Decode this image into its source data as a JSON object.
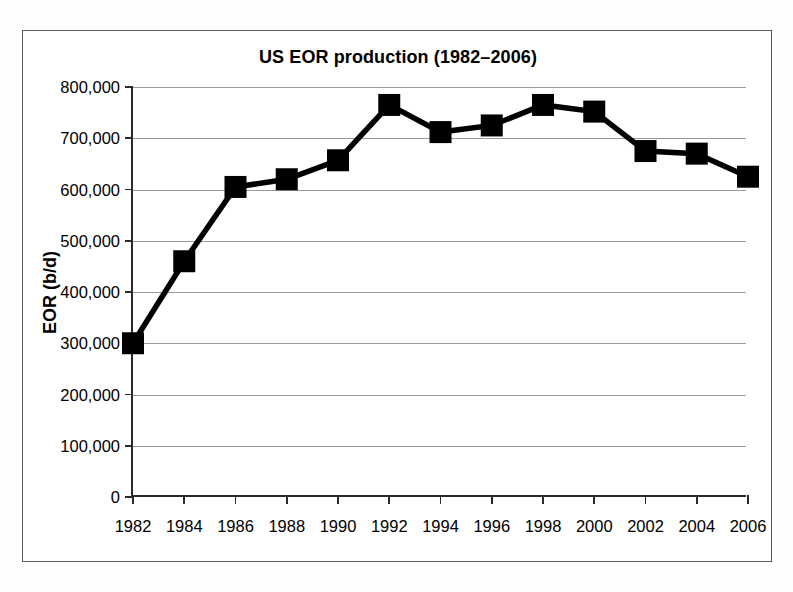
{
  "chart_data": {
    "type": "line",
    "title": "US EOR production (1982–2006)",
    "xlabel": "",
    "ylabel": "EOR (b/d)",
    "categories": [
      1982,
      1984,
      1986,
      1988,
      1990,
      1992,
      1994,
      1996,
      1998,
      2000,
      2002,
      2004,
      2006
    ],
    "x_tick_labels": [
      "1982",
      "1984",
      "1986",
      "1988",
      "1990",
      "1992",
      "1994",
      "1996",
      "1998",
      "2000",
      "2002",
      "2004",
      "2006"
    ],
    "values": [
      300000,
      460000,
      605000,
      620000,
      657000,
      765000,
      712000,
      725000,
      765000,
      752000,
      675000,
      670000,
      625000
    ],
    "series": [
      {
        "name": "US EOR production",
        "values": [
          300000,
          460000,
          605000,
          620000,
          657000,
          765000,
          712000,
          725000,
          765000,
          752000,
          675000,
          670000,
          625000
        ]
      }
    ],
    "ylim": [
      0,
      800000
    ],
    "xlim": [
      1982,
      2006
    ],
    "y_ticks": [
      0,
      100000,
      200000,
      300000,
      400000,
      500000,
      600000,
      700000,
      800000
    ],
    "y_tick_labels": [
      "0",
      "100,000",
      "200,000",
      "300,000",
      "400,000",
      "500,000",
      "600,000",
      "700,000",
      "800,000"
    ],
    "grid": true,
    "grid_axis": "y",
    "legend": false,
    "legend_position": "none",
    "marker": "square",
    "line_color": "#000000",
    "marker_color": "#000000",
    "gridline_color": "#9a9a9a",
    "axis_color": "#2a2a2a",
    "background_color": "#ffffff"
  }
}
